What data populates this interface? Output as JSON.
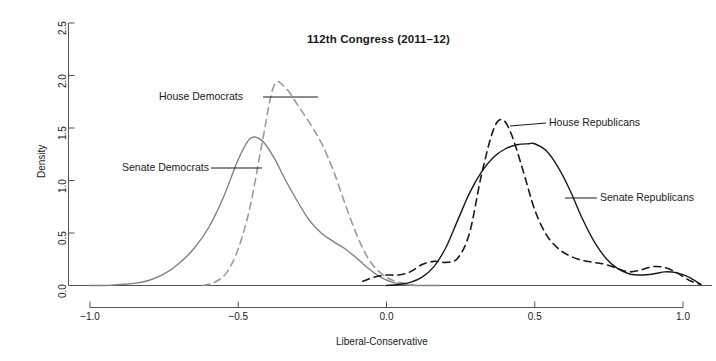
{
  "figure": {
    "title": "112th Congress (2011–12)",
    "background": "#ffffff"
  },
  "chart_data": {
    "type": "line",
    "title": "112th Congress (2011–12)",
    "xlabel": "Liberal-Conservative",
    "ylabel": "Density",
    "xlim": [
      -1.0,
      1.0
    ],
    "ylim": [
      0.0,
      2.5
    ],
    "xticks": [
      "-1.0",
      "-0.5",
      "0.0",
      "0.5",
      "1.0"
    ],
    "xtick_values": [
      -1.0,
      -0.5,
      0.0,
      0.5,
      1.0
    ],
    "yticks": [
      "0.0",
      "0.5",
      "1.0",
      "1.5",
      "2.0",
      "2.5"
    ],
    "ytick_values": [
      0.0,
      0.5,
      1.0,
      1.5,
      2.0,
      2.5
    ],
    "grid": false,
    "legend_position": "inline-annotations",
    "colors": {
      "senate_democrats": "#808080",
      "house_democrats": "#9a9a9a",
      "house_republicans": "#1a1a1a",
      "senate_republicans": "#1a1a1a",
      "axis": "#555555"
    },
    "series": [
      {
        "name": "Senate Democrats",
        "style": "solid",
        "color": "#808080",
        "peak_x": -0.46,
        "peak_y": 1.4,
        "x": [
          -1.0,
          -0.95,
          -0.9,
          -0.85,
          -0.8,
          -0.75,
          -0.7,
          -0.65,
          -0.6,
          -0.55,
          -0.5,
          -0.46,
          -0.42,
          -0.38,
          -0.34,
          -0.3,
          -0.26,
          -0.22,
          -0.18,
          -0.14,
          -0.1,
          -0.06,
          -0.02,
          0.02,
          0.06,
          0.1,
          0.14,
          0.18
        ],
        "values": [
          0.0,
          0.0,
          0.01,
          0.02,
          0.05,
          0.11,
          0.21,
          0.35,
          0.55,
          0.84,
          1.2,
          1.4,
          1.38,
          1.22,
          1.0,
          0.8,
          0.62,
          0.5,
          0.42,
          0.35,
          0.26,
          0.16,
          0.08,
          0.03,
          0.01,
          0.0,
          0.0,
          0.0
        ]
      },
      {
        "name": "House Democrats",
        "style": "dashed",
        "color": "#9a9a9a",
        "peak_x": -0.37,
        "peak_y": 1.92,
        "x": [
          -0.62,
          -0.58,
          -0.54,
          -0.5,
          -0.46,
          -0.42,
          -0.38,
          -0.34,
          -0.3,
          -0.26,
          -0.22,
          -0.18,
          -0.14,
          -0.1,
          -0.06,
          -0.02,
          0.02,
          0.06,
          0.1
        ],
        "values": [
          0.0,
          0.03,
          0.12,
          0.35,
          0.75,
          1.35,
          1.9,
          1.88,
          1.72,
          1.55,
          1.36,
          1.1,
          0.78,
          0.48,
          0.25,
          0.12,
          0.05,
          0.02,
          0.0
        ]
      },
      {
        "name": "House Republicans",
        "style": "dashed",
        "color": "#1a1a1a",
        "peak_x": 0.39,
        "peak_y": 1.58,
        "x": [
          -0.08,
          -0.04,
          0.0,
          0.04,
          0.08,
          0.12,
          0.16,
          0.2,
          0.24,
          0.28,
          0.32,
          0.36,
          0.39,
          0.42,
          0.46,
          0.5,
          0.54,
          0.58,
          0.62,
          0.66,
          0.7,
          0.74,
          0.78,
          0.82,
          0.86,
          0.9,
          0.94,
          0.98,
          1.02,
          1.06
        ],
        "values": [
          0.04,
          0.08,
          0.1,
          0.1,
          0.13,
          0.2,
          0.23,
          0.22,
          0.26,
          0.5,
          1.05,
          1.48,
          1.58,
          1.45,
          1.1,
          0.72,
          0.48,
          0.35,
          0.28,
          0.24,
          0.22,
          0.2,
          0.16,
          0.13,
          0.15,
          0.18,
          0.17,
          0.12,
          0.05,
          0.01
        ]
      },
      {
        "name": "Senate Republicans",
        "style": "solid",
        "color": "#1a1a1a",
        "peak_x": 0.5,
        "peak_y": 1.35,
        "x": [
          0.0,
          0.04,
          0.08,
          0.12,
          0.16,
          0.2,
          0.24,
          0.28,
          0.32,
          0.36,
          0.4,
          0.44,
          0.48,
          0.5,
          0.54,
          0.58,
          0.62,
          0.66,
          0.7,
          0.74,
          0.78,
          0.82,
          0.86,
          0.9,
          0.94,
          0.98,
          1.02,
          1.06
        ],
        "values": [
          0.0,
          0.01,
          0.03,
          0.08,
          0.18,
          0.36,
          0.62,
          0.88,
          1.08,
          1.22,
          1.3,
          1.34,
          1.35,
          1.35,
          1.28,
          1.12,
          0.9,
          0.64,
          0.42,
          0.26,
          0.16,
          0.11,
          0.1,
          0.11,
          0.13,
          0.12,
          0.08,
          0.01
        ]
      }
    ],
    "annotations": [
      {
        "label": "House Democrats",
        "anchor": "left-of-curve"
      },
      {
        "label": "Senate Democrats",
        "anchor": "left-of-curve"
      },
      {
        "label": "House Republicans",
        "anchor": "right-of-curve"
      },
      {
        "label": "Senate Republicans",
        "anchor": "right-of-curve"
      }
    ]
  }
}
